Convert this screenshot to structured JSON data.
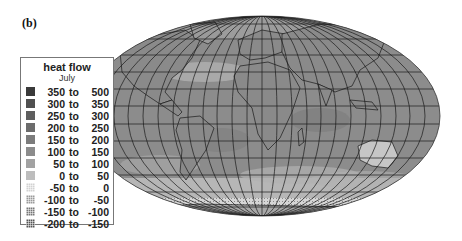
{
  "panel_label": "(b)",
  "legend": {
    "title": "heat flow",
    "subtitle": "July",
    "entries": [
      {
        "lo": "350",
        "to": "to",
        "hi": "500",
        "color": "#3a3a3a",
        "hatched": false
      },
      {
        "lo": "300",
        "to": "to",
        "hi": "350",
        "color": "#505050",
        "hatched": false
      },
      {
        "lo": "250",
        "to": "to",
        "hi": "300",
        "color": "#5e5e5e",
        "hatched": false
      },
      {
        "lo": "200",
        "to": "to",
        "hi": "250",
        "color": "#6c6c6c",
        "hatched": false
      },
      {
        "lo": "150",
        "to": "to",
        "hi": "200",
        "color": "#7c7c7c",
        "hatched": false
      },
      {
        "lo": "100",
        "to": "to",
        "hi": "150",
        "color": "#8c8c8c",
        "hatched": false
      },
      {
        "lo": "50",
        "to": "to",
        "hi": "100",
        "color": "#a2a2a2",
        "hatched": false
      },
      {
        "lo": "0",
        "to": "to",
        "hi": "50",
        "color": "#bdbdbd",
        "hatched": false
      },
      {
        "lo": "-50",
        "to": "to",
        "hi": "0",
        "color": "#d2d2d2",
        "hatched": true
      },
      {
        "lo": "-100",
        "to": "to",
        "hi": "-50",
        "color": "#9a9a9a",
        "hatched": true
      },
      {
        "lo": "-150",
        "to": "to",
        "hi": "-100",
        "color": "#777777",
        "hatched": true
      },
      {
        "lo": "-200",
        "to": "to",
        "hi": "-150",
        "color": "#555555",
        "hatched": true
      }
    ]
  },
  "map": {
    "projection": "Mollweide (elliptical world map)",
    "variable": "heat flow",
    "month": "July",
    "ocean_fill": "#8a8a8a",
    "land_fill": "#9a9a9a",
    "grid_color": "#222222",
    "coastline_color": "#1a1a1a"
  }
}
